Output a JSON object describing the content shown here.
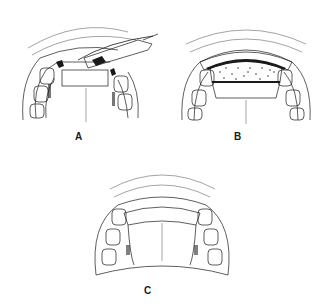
{
  "figure": {
    "panels": [
      {
        "id": "A",
        "label": "A",
        "description": "maxillary arch with instrument placing graft in anterior defect"
      },
      {
        "id": "B",
        "label": "B",
        "description": "maxillary arch with bone graft packed in anterior defect"
      },
      {
        "id": "C",
        "label": "C",
        "description": "maxillary arch with healed anterior ridge"
      }
    ],
    "colors": {
      "line": "#1a1a1a",
      "background": "#ffffff",
      "hatch": "#333333"
    }
  }
}
